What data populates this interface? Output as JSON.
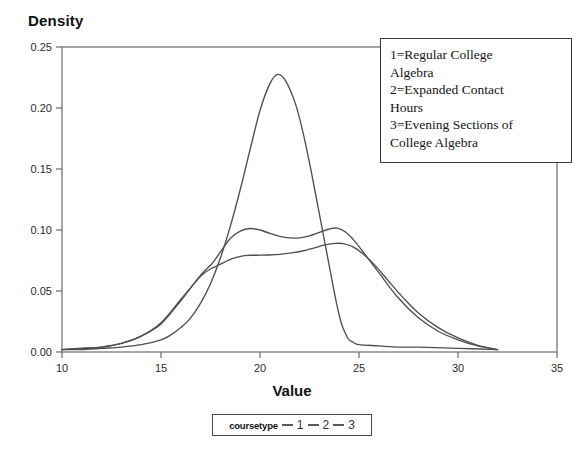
{
  "chart_data": {
    "type": "line",
    "title": "",
    "xlabel": "Value",
    "ylabel": "Density",
    "xlim": [
      10,
      35
    ],
    "ylim": [
      0.0,
      0.25
    ],
    "xticks": [
      10,
      15,
      20,
      25,
      30,
      35
    ],
    "xtick_labels": [
      "10",
      "15",
      "20",
      "25",
      "30",
      "35"
    ],
    "yticks": [
      0.0,
      0.05,
      0.1,
      0.15,
      0.2,
      0.25
    ],
    "ytick_labels": [
      "0.00",
      "0.05",
      "0.10",
      "0.15",
      "0.20",
      "0.25"
    ],
    "grid": false,
    "legend_position": "bottom",
    "line_color": "#4f4f4f",
    "series": [
      {
        "name": "1",
        "description": "Regular College Algebra",
        "x": [
          10.0,
          11.0,
          12.0,
          13.0,
          14.0,
          15.0,
          15.5,
          16.0,
          16.5,
          17.0,
          17.5,
          18.0,
          18.5,
          19.0,
          19.5,
          20.0,
          20.5,
          20.9,
          21.3,
          21.8,
          22.2,
          22.6,
          23.0,
          23.4,
          23.8,
          24.1,
          24.35,
          24.5,
          24.7,
          25.0,
          26.0,
          27.0,
          28.0,
          30.0,
          32.0
        ],
        "y": [
          0.002,
          0.002,
          0.003,
          0.004,
          0.006,
          0.01,
          0.014,
          0.02,
          0.028,
          0.04,
          0.056,
          0.077,
          0.103,
          0.133,
          0.166,
          0.198,
          0.22,
          0.2275,
          0.222,
          0.203,
          0.178,
          0.147,
          0.113,
          0.079,
          0.045,
          0.024,
          0.014,
          0.01,
          0.008,
          0.006,
          0.005,
          0.004,
          0.004,
          0.003,
          0.002
        ]
      },
      {
        "name": "2",
        "description": "Expanded Contact Hours",
        "x": [
          10.0,
          11.0,
          12.0,
          13.0,
          14.0,
          15.0,
          16.0,
          17.0,
          17.6,
          18.0,
          18.5,
          19.0,
          19.5,
          20.0,
          20.5,
          21.0,
          21.5,
          22.0,
          22.5,
          23.0,
          23.5,
          23.9,
          24.3,
          24.8,
          25.3,
          26.0,
          27.0,
          28.0,
          29.0,
          30.0,
          31.0,
          32.0
        ],
        "y": [
          0.002,
          0.003,
          0.004,
          0.007,
          0.013,
          0.023,
          0.042,
          0.063,
          0.073,
          0.082,
          0.093,
          0.099,
          0.1012,
          0.1,
          0.0972,
          0.0948,
          0.0935,
          0.0936,
          0.0952,
          0.098,
          0.1008,
          0.1015,
          0.0985,
          0.0905,
          0.08,
          0.065,
          0.044,
          0.028,
          0.017,
          0.01,
          0.005,
          0.002
        ]
      },
      {
        "name": "3",
        "description": "Evening Sections of College Algebra",
        "x": [
          10.0,
          11.0,
          12.0,
          13.0,
          14.0,
          15.0,
          16.0,
          17.0,
          17.5,
          18.0,
          18.6,
          19.2,
          19.8,
          20.4,
          21.0,
          21.6,
          22.2,
          22.8,
          23.3,
          23.8,
          24.2,
          24.7,
          25.2,
          25.8,
          26.5,
          27.2,
          28.0,
          29.0,
          30.0,
          31.0,
          32.0
        ],
        "y": [
          0.002,
          0.003,
          0.004,
          0.007,
          0.013,
          0.024,
          0.043,
          0.062,
          0.068,
          0.072,
          0.0765,
          0.079,
          0.0793,
          0.0795,
          0.08,
          0.0812,
          0.083,
          0.0855,
          0.0878,
          0.089,
          0.0888,
          0.0862,
          0.0805,
          0.0712,
          0.058,
          0.045,
          0.032,
          0.02,
          0.0115,
          0.0055,
          0.002
        ]
      }
    ]
  },
  "legend_note": {
    "lines": [
      "1=Regular College",
      "Algebra",
      "2=Expanded Contact",
      "Hours",
      "3=Evening Sections of",
      "College Algebra"
    ]
  },
  "coursetype_legend": {
    "label": "coursetype",
    "items": [
      "1",
      "2",
      "3"
    ]
  }
}
